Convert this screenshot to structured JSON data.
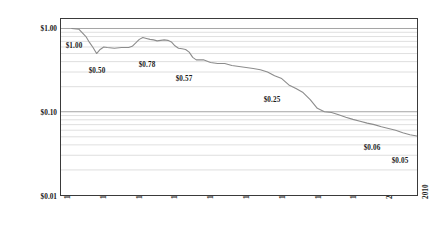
{
  "chart_data": {
    "type": "line",
    "title": "",
    "subtitle": "",
    "xlabel": "",
    "ylabel": "PRICE (LOG)",
    "grid": true,
    "legend_position": "none",
    "yscale": "log",
    "ylim": [
      0.01,
      1.3
    ],
    "xlim": [
      1910,
      2010
    ],
    "y_ticks": [
      {
        "value": 1.0,
        "label": "$1.00"
      },
      {
        "value": 0.1,
        "label": "$0.10"
      },
      {
        "value": 0.01,
        "label": "$0.01"
      }
    ],
    "y_minor_gridlines": [
      0.02,
      0.03,
      0.04,
      0.05,
      0.06,
      0.07,
      0.08,
      0.09,
      0.2,
      0.3,
      0.4,
      0.5,
      0.6,
      0.7,
      0.8,
      0.9
    ],
    "x_ticks": [
      {
        "value": 1910,
        "label": "1910"
      },
      {
        "value": 1920,
        "label": "1920"
      },
      {
        "value": 1930,
        "label": "1930"
      },
      {
        "value": 1940,
        "label": "1940"
      },
      {
        "value": 1950,
        "label": "1950"
      },
      {
        "value": 1960,
        "label": "1960"
      },
      {
        "value": 1970,
        "label": "1970"
      },
      {
        "value": 1980,
        "label": "1980"
      },
      {
        "value": 1990,
        "label": "1990"
      },
      {
        "value": 2000,
        "label": "2000"
      },
      {
        "value": 2010,
        "label": "2010"
      }
    ],
    "series": [
      {
        "name": "Purchasing power of the dollar",
        "color": "#8c8c8c",
        "x": [
          1913,
          1915,
          1917,
          1918,
          1919,
          1920,
          1921,
          1922,
          1923,
          1925,
          1927,
          1929,
          1930,
          1931,
          1932,
          1933,
          1934,
          1935,
          1936,
          1937,
          1938,
          1939,
          1940,
          1941,
          1942,
          1943,
          1944,
          1945,
          1946,
          1947,
          1948,
          1949,
          1950,
          1952,
          1954,
          1956,
          1958,
          1960,
          1962,
          1964,
          1966,
          1968,
          1970,
          1972,
          1974,
          1976,
          1978,
          1980,
          1982,
          1984,
          1986,
          1988,
          1990,
          1992,
          1994,
          1996,
          1998,
          2000,
          2002,
          2004,
          2006,
          2008,
          2010
        ],
        "y": [
          1.0,
          0.98,
          0.8,
          0.68,
          0.59,
          0.5,
          0.56,
          0.6,
          0.59,
          0.58,
          0.59,
          0.59,
          0.61,
          0.67,
          0.74,
          0.78,
          0.76,
          0.74,
          0.73,
          0.71,
          0.72,
          0.73,
          0.72,
          0.69,
          0.62,
          0.58,
          0.57,
          0.56,
          0.52,
          0.45,
          0.42,
          0.42,
          0.42,
          0.39,
          0.38,
          0.38,
          0.36,
          0.35,
          0.34,
          0.33,
          0.32,
          0.3,
          0.27,
          0.25,
          0.21,
          0.19,
          0.17,
          0.14,
          0.11,
          0.1,
          0.098,
          0.092,
          0.086,
          0.081,
          0.077,
          0.073,
          0.07,
          0.066,
          0.063,
          0.06,
          0.056,
          0.053,
          0.051
        ]
      }
    ],
    "annotations": [
      {
        "label": "$1.00",
        "x": 1913,
        "y": 1.0,
        "px": 74,
        "py": 46
      },
      {
        "label": "$0.50",
        "x": 1920,
        "y": 0.5,
        "px": 97,
        "py": 71
      },
      {
        "label": "$0.78",
        "x": 1933,
        "y": 0.78,
        "px": 147,
        "py": 65
      },
      {
        "label": "$0.57",
        "x": 1944,
        "y": 0.57,
        "px": 184,
        "py": 79
      },
      {
        "label": "$0.25",
        "x": 1970,
        "y": 0.25,
        "px": 272,
        "py": 100
      },
      {
        "label": "$0.06",
        "x": 1996,
        "y": 0.06,
        "px": 372,
        "py": 148
      },
      {
        "label": "$0.05",
        "x": 2010,
        "y": 0.05,
        "px": 400,
        "py": 161
      }
    ],
    "eras": [
      {
        "label": "Interwar",
        "start": 1918,
        "end": 1944
      },
      {
        "label": "Bretton Woods",
        "start": 1944,
        "end": 1971
      },
      {
        "label": "International Paper Dollar",
        "start": 1971,
        "end": 2010
      }
    ]
  }
}
